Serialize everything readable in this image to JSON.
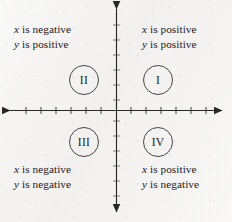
{
  "figure": {
    "name": "cartesian-quadrants-diagram",
    "background_color": "#f4f3f1",
    "ink_color": "#24201e"
  },
  "axes": {
    "origin": {
      "x": 116,
      "y": 110
    },
    "x_axis": {
      "start_x": 9,
      "end_x": 223,
      "y": 110,
      "arrowheads": "both",
      "tick_count_per_side": 6,
      "tick_spacing_px": 15,
      "tick_length_px": 7
    },
    "y_axis": {
      "x": 116,
      "start_y": 8,
      "end_y": 213,
      "arrowheads": "both",
      "tick_count_per_side": 6,
      "tick_spacing_px": 15,
      "tick_length_px": 7
    },
    "grid": "off",
    "tick_labels": []
  },
  "quadrants": [
    {
      "id": "I",
      "numeral": "I",
      "position": "top-right",
      "x_sign_line": {
        "variable": "x",
        "predicate": " is positive"
      },
      "y_sign_line": {
        "variable": "y",
        "predicate": " is positive"
      }
    },
    {
      "id": "II",
      "numeral": "II",
      "position": "top-left",
      "x_sign_line": {
        "variable": "x",
        "predicate": " is negative"
      },
      "y_sign_line": {
        "variable": "y",
        "predicate": " is positive"
      }
    },
    {
      "id": "III",
      "numeral": "III",
      "position": "bottom-left",
      "x_sign_line": {
        "variable": "x",
        "predicate": " is negative"
      },
      "y_sign_line": {
        "variable": "y",
        "predicate": " is negative"
      }
    },
    {
      "id": "IV",
      "numeral": "IV",
      "position": "bottom-right",
      "x_sign_line": {
        "variable": "x",
        "predicate": " is positive"
      },
      "y_sign_line": {
        "variable": "y",
        "predicate": " is negative"
      }
    }
  ]
}
